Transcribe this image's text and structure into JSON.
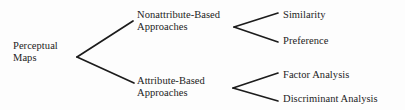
{
  "diagram": {
    "type": "hierarchy-tree",
    "title": "Perceptual Maps",
    "orientation": "left-to-right",
    "line_color": "#1c1c1c",
    "text_color": "#1c1c1c",
    "background_color": "#fdfdfd",
    "nodes": {
      "root": {
        "line1": "Perceptual",
        "line2": "Maps"
      },
      "level1": [
        {
          "id": "nonattribute-based-approaches",
          "line1": "Nonattribute-Based",
          "line2": "Approaches"
        },
        {
          "id": "attribute-based-approaches",
          "line1": "Attribute-Based",
          "line2": "Approaches"
        }
      ],
      "level2": [
        {
          "id": "similarity",
          "label": "Similarity",
          "parent": "nonattribute-based-approaches"
        },
        {
          "id": "preference",
          "label": "Preference",
          "parent": "nonattribute-based-approaches"
        },
        {
          "id": "factor-analysis",
          "label": "Factor Analysis",
          "parent": "attribute-based-approaches"
        },
        {
          "id": "discriminant-analysis",
          "label": "Discriminant Analysis",
          "parent": "attribute-based-approaches"
        }
      ]
    },
    "connectors": [
      {
        "id": "root-to-nonattribute",
        "x1": 77,
        "y1": 57,
        "x2": 133,
        "y2": 21
      },
      {
        "id": "root-to-attribute",
        "x1": 77,
        "y1": 57,
        "x2": 134,
        "y2": 83
      },
      {
        "id": "nonattribute-to-similarity",
        "x1": 234,
        "y1": 27,
        "x2": 278,
        "y2": 13
      },
      {
        "id": "nonattribute-to-preference",
        "x1": 234,
        "y1": 27,
        "x2": 278,
        "y2": 42
      },
      {
        "id": "attribute-to-factor-analysis",
        "x1": 233,
        "y1": 88,
        "x2": 278,
        "y2": 73
      },
      {
        "id": "attribute-to-discriminant-analysis",
        "x1": 233,
        "y1": 88,
        "x2": 278,
        "y2": 101
      }
    ]
  }
}
